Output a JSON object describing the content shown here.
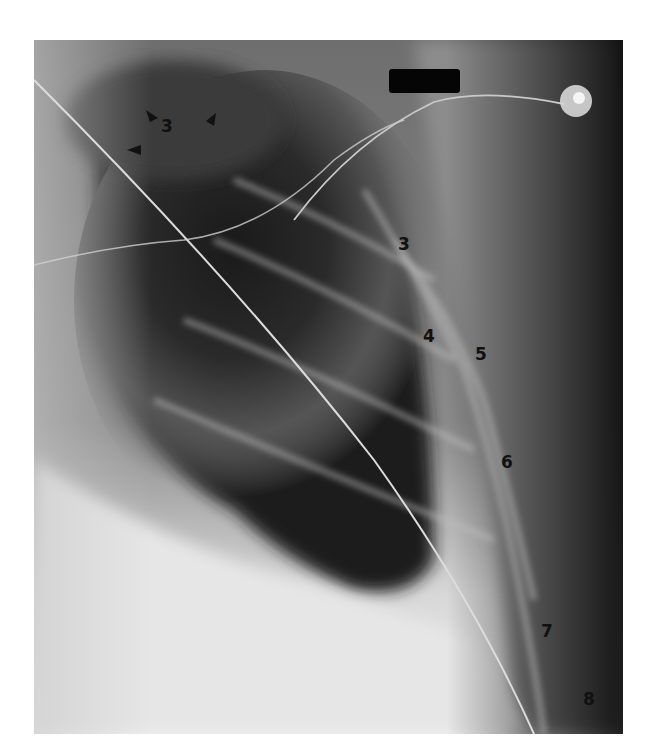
{
  "image": {
    "type": "chest-radiograph",
    "view": "lateral-oblique",
    "annotations": {
      "rib_labels": [
        {
          "text": "3",
          "x": 167,
          "y": 126,
          "note": "top of image, between arrowheads"
        },
        {
          "text": "3",
          "x": 404,
          "y": 244
        },
        {
          "text": "4",
          "x": 429,
          "y": 336
        },
        {
          "text": "5",
          "x": 481,
          "y": 354
        },
        {
          "text": "6",
          "x": 507,
          "y": 462
        },
        {
          "text": "7",
          "x": 547,
          "y": 631
        },
        {
          "text": "8",
          "x": 589,
          "y": 699
        }
      ],
      "arrowheads": [
        {
          "x": 150,
          "y": 117,
          "direction": "down-right"
        },
        {
          "x": 212,
          "y": 121,
          "direction": "down-left"
        },
        {
          "x": 136,
          "y": 150,
          "direction": "right"
        }
      ]
    },
    "overlays": {
      "redaction_bar": true,
      "ecg_electrode": true,
      "lead_wire": true
    },
    "colors": {
      "label": "#111111",
      "background": "#ffffff",
      "redaction": "#050505"
    }
  }
}
